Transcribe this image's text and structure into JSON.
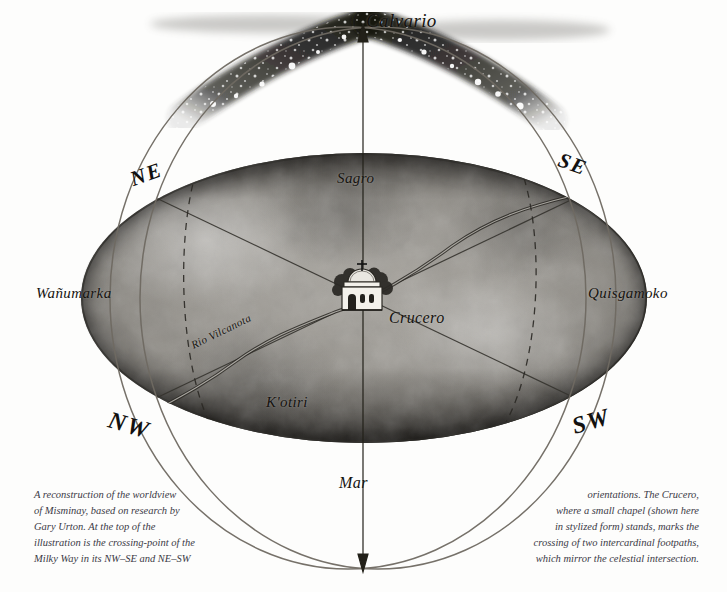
{
  "illustration": {
    "title": "Misminay worldview reconstruction",
    "zenith_label": "Calvario",
    "center_label": "Crucero",
    "quadrants": [
      {
        "name": "Sagro",
        "position": "north"
      },
      {
        "name": "Quisgamoko",
        "position": "east"
      },
      {
        "name": "K'otiri",
        "position": "south"
      },
      {
        "name": "Wañumarka",
        "position": "west"
      }
    ],
    "river_label": "Rio Vilcanota",
    "sea_label": "Mar",
    "directions": [
      {
        "label": "NE",
        "position": "upper-left"
      },
      {
        "label": "SE",
        "position": "upper-right"
      },
      {
        "label": "NW",
        "position": "lower-left"
      },
      {
        "label": "SW",
        "position": "lower-right"
      }
    ],
    "captions": {
      "left": "A reconstruction of the worldview of Misminay, based on research by Gary Urton. At the top of the illustration is the crossing-point of the Milky Way in its NW–SE and NE–SW",
      "right": "orientations. The Crucero, where a small chapel (shown here in stylized form) stands, marks the crossing of two intercardinal footpaths, which mirror the celestial intersection."
    },
    "caption_left_lines": [
      "A reconstruction of the worldview",
      "of Misminay, based on research by",
      "Gary Urton. At the top of the",
      "illustration is the crossing-point of the",
      "Milky Way in its NW–SE and NE–SW"
    ],
    "caption_right_lines": [
      "orientations. The Crucero,",
      "where a small chapel (shown here",
      "in stylized form) stands, marks the",
      "crossing of two intercardinal footpaths,",
      "which mirror the celestial intersection."
    ],
    "colors": {
      "background": "#fdfdfc",
      "ink": "#15130f",
      "disk_light": "#a9a6a0",
      "disk_dark": "#3a3834",
      "circle_stroke": "#6f6a62",
      "caption_ink": "#3b3a46",
      "water_ink": "#5b5a57"
    }
  }
}
